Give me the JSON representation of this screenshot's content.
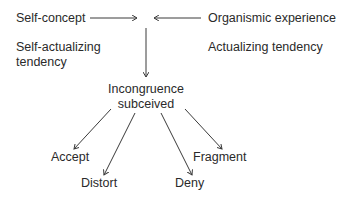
{
  "diagram": {
    "top_left": {
      "label": "Self-concept"
    },
    "top_right": {
      "label": "Organismic experience"
    },
    "left_sub": {
      "line1": "Self-actualizing",
      "line2": "tendency"
    },
    "right_sub": {
      "label": "Actualizing tendency"
    },
    "center": {
      "line1": "Incongruence",
      "line2": "subceived"
    },
    "outcomes": [
      {
        "label": "Accept"
      },
      {
        "label": "Distort"
      },
      {
        "label": "Deny"
      },
      {
        "label": "Fragment"
      }
    ],
    "colors": {
      "text": "#2a2a2a",
      "lines": "#3a3a3a",
      "background": "#ffffff"
    }
  }
}
